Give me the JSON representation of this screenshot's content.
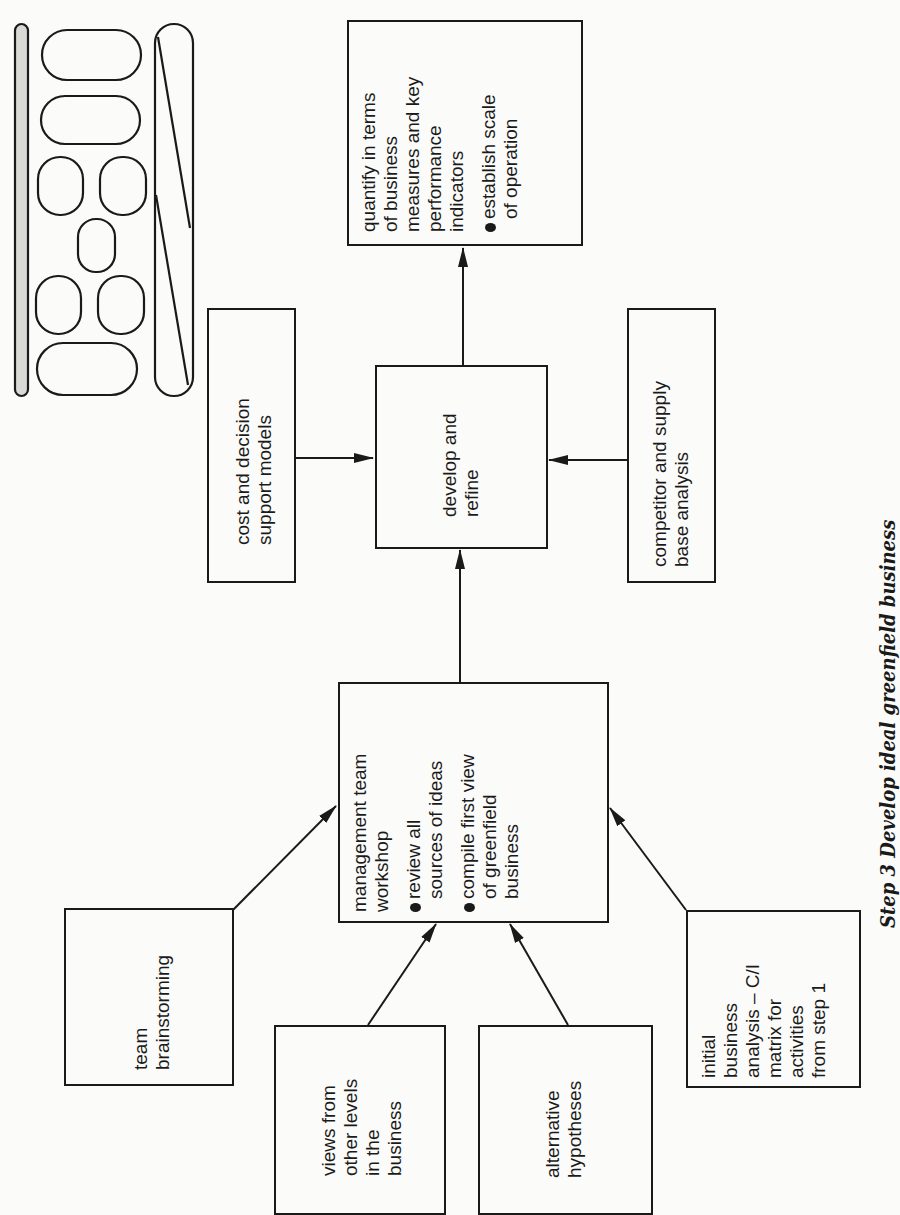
{
  "diagram": {
    "caption": "Step 3 Develop ideal greenfield business",
    "nodes": {
      "kpi": {
        "lines": [
          "quantify in terms",
          "of business",
          "measures and key",
          "performance",
          "indicators"
        ],
        "bullets": [
          [
            "establish scale",
            "of operation"
          ]
        ]
      },
      "cost_models": {
        "lines": [
          "cost and decision",
          "support models"
        ]
      },
      "develop": {
        "lines": [
          "develop and",
          "refine"
        ]
      },
      "competitor": {
        "lines": [
          "competitor and supply",
          "base analysis"
        ]
      },
      "workshop": {
        "lines": [
          "management team",
          "workshop"
        ],
        "bullets": [
          [
            "review all",
            "sources of ideas"
          ],
          [
            "compile first view",
            "of greenfield",
            "business"
          ]
        ]
      },
      "brainstorming": {
        "lines": [
          "team",
          "brainstorming"
        ]
      },
      "views": {
        "lines": [
          "views from",
          "other levels",
          "in the",
          "business"
        ]
      },
      "hypotheses": {
        "lines": [
          "alternative",
          "hypotheses"
        ]
      },
      "initial_analysis": {
        "lines": [
          "initial",
          "business",
          "analysis – C/I",
          "matrix for",
          "activities",
          "from step 1"
        ]
      }
    },
    "edges": [
      {
        "from": "brainstorming",
        "to": "workshop"
      },
      {
        "from": "views",
        "to": "workshop"
      },
      {
        "from": "hypotheses",
        "to": "workshop"
      },
      {
        "from": "initial_analysis",
        "to": "workshop"
      },
      {
        "from": "workshop",
        "to": "develop"
      },
      {
        "from": "cost_models",
        "to": "develop"
      },
      {
        "from": "competitor",
        "to": "develop"
      },
      {
        "from": "develop",
        "to": "kpi"
      }
    ],
    "key_icon": "process-key-icon"
  }
}
